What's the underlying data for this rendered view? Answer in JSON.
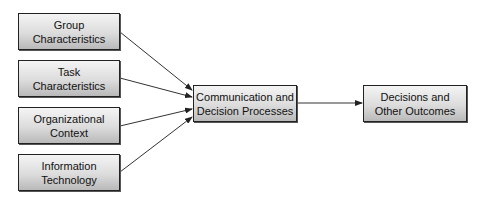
{
  "diagram": {
    "inputs": [
      {
        "line1": "Group",
        "line2": "Characteristics"
      },
      {
        "line1": "Task",
        "line2": "Characteristics"
      },
      {
        "line1": "Organizational",
        "line2": "Context"
      },
      {
        "line1": "Information",
        "line2": "Technology"
      }
    ],
    "process": {
      "line1": "Communication and",
      "line2": "Decision Processes"
    },
    "output": {
      "line1": "Decisions and",
      "line2": "Other Outcomes"
    },
    "colors": {
      "border": "#222222",
      "arrow": "#333333",
      "fill_top": "#f4f4f4",
      "fill_bottom": "#b9b9b9"
    }
  }
}
